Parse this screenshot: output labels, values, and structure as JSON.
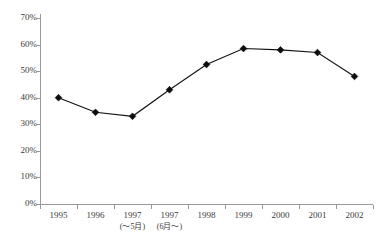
{
  "chart_data": {
    "type": "line",
    "title": "",
    "subtitle": "",
    "xlabel": "",
    "ylabel": "",
    "categories": [
      {
        "label": "1995",
        "sub": ""
      },
      {
        "label": "1996",
        "sub": ""
      },
      {
        "label": "1997",
        "sub": "(～5月)"
      },
      {
        "label": "1997",
        "sub": "(6月～)"
      },
      {
        "label": "1998",
        "sub": ""
      },
      {
        "label": "1999",
        "sub": ""
      },
      {
        "label": "2000",
        "sub": ""
      },
      {
        "label": "2001",
        "sub": ""
      },
      {
        "label": "2002",
        "sub": ""
      }
    ],
    "values": [
      40,
      34.5,
      33,
      43,
      52.5,
      58.5,
      58,
      57,
      48
    ],
    "ylim": [
      0,
      70
    ],
    "ytick_step": 10,
    "ytick_labels": [
      "0%",
      "10%",
      "20%",
      "30%",
      "40%",
      "50%",
      "60%",
      "70%"
    ],
    "grid": false,
    "legend": false,
    "legend_position": "none",
    "series_color": "#111111",
    "marker": "diamond",
    "axis_color": "#9a9a9a",
    "background_color": "#ffffff"
  }
}
